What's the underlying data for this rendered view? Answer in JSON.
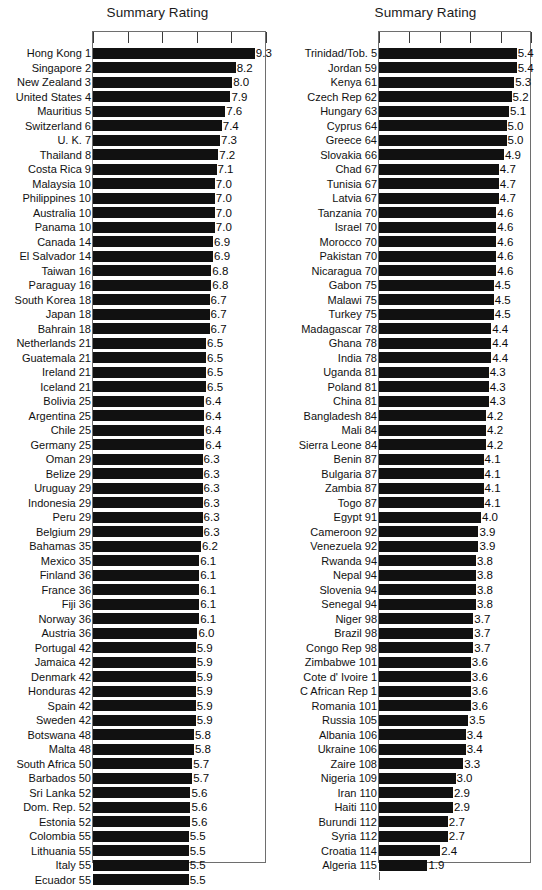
{
  "document": {
    "cut_off_heading": "Summary Ratings"
  },
  "chart_data": [
    {
      "panel": "left",
      "type": "bar",
      "orientation": "horizontal",
      "title": "Summary Rating",
      "xlabel": "",
      "ylabel": "",
      "xlim": [
        0,
        10
      ],
      "xticks": [
        0,
        2,
        4,
        6,
        8,
        10
      ],
      "grid": false,
      "legend": null,
      "tick_count": 6,
      "categories": [
        "Hong Kong 1",
        "Singapore 2",
        "New Zealand 3",
        "United States 4",
        "Mauritius 5",
        "Switzerland 6",
        "U. K. 7",
        "Thailand 8",
        "Costa Rica 9",
        "Malaysia 10",
        "Philippines 10",
        "Australia 10",
        "Panama 10",
        "Canada 14",
        "El Salvador 14",
        "Taiwan 16",
        "Paraguay 16",
        "South Korea 18",
        "Japan 18",
        "Bahrain 18",
        "Netherlands 21",
        "Guatemala 21",
        "Ireland 21",
        "Iceland 21",
        "Bolivia 25",
        "Argentina 25",
        "Chile 25",
        "Germany 25",
        "Oman 29",
        "Belize 29",
        "Uruguay 29",
        "Indonesia 29",
        "Peru 29",
        "Belgium 29",
        "Bahamas 35",
        "Mexico 35",
        "Finland 36",
        "France 36",
        "Fiji 36",
        "Norway 36",
        "Austria 36",
        "Portugal 42",
        "Jamaica 42",
        "Denmark 42",
        "Honduras 42",
        "Spain 42",
        "Sweden 42",
        "Botswana 48",
        "Malta 48",
        "South Africa 50",
        "Barbados 50",
        "Sri Lanka 52",
        "Dom. Rep. 52",
        "Estonia 52",
        "Colombia 55",
        "Lithuania 55",
        "Italy 55",
        "Ecuador 55"
      ],
      "values": [
        9.3,
        8.2,
        8.0,
        7.9,
        7.6,
        7.4,
        7.3,
        7.2,
        7.1,
        7.0,
        7.0,
        7.0,
        7.0,
        6.9,
        6.9,
        6.8,
        6.8,
        6.7,
        6.7,
        6.7,
        6.5,
        6.5,
        6.5,
        6.5,
        6.4,
        6.4,
        6.4,
        6.4,
        6.3,
        6.3,
        6.3,
        6.3,
        6.3,
        6.3,
        6.2,
        6.1,
        6.1,
        6.1,
        6.1,
        6.1,
        6.0,
        5.9,
        5.9,
        5.9,
        5.9,
        5.9,
        5.9,
        5.8,
        5.8,
        5.7,
        5.7,
        5.6,
        5.6,
        5.6,
        5.5,
        5.5,
        5.5,
        5.5
      ],
      "value_labels": [
        "9.3",
        "8.2",
        "8.0",
        "7.9",
        "7.6",
        "7.4",
        "7.3",
        "7.2",
        "7.1",
        "7.0",
        "7.0",
        "7.0",
        "7.0",
        "6.9",
        "6.9",
        "6.8",
        "6.8",
        "6.7",
        "6.7",
        "6.7",
        "6.5",
        "6.5",
        "6.5",
        "6.5",
        "6.4",
        "6.4",
        "6.4",
        "6.4",
        "6.3",
        "6.3",
        "6.3",
        "6.3",
        "6.3",
        "6.3",
        "6.2",
        "6.1",
        "6.1",
        "6.1",
        "6.1",
        "6.1",
        "6.0",
        "5.9",
        "5.9",
        "5.9",
        "5.9",
        "5.9",
        "5.9",
        "5.8",
        "5.8",
        "5.7",
        "5.7",
        "5.6",
        "5.6",
        "5.6",
        "5.5",
        "5.5",
        "5.5",
        "5.5"
      ]
    },
    {
      "panel": "right",
      "type": "bar",
      "orientation": "horizontal",
      "title": "Summary Rating",
      "xlabel": "",
      "ylabel": "",
      "xlim": [
        0,
        6
      ],
      "xticks": [
        0,
        1,
        2,
        3,
        4,
        5
      ],
      "grid": false,
      "legend": null,
      "tick_count": 6,
      "categories": [
        "Trinidad/Tob. 5",
        "Jordan 59",
        "Kenya 61",
        "Czech Rep 62",
        "Hungary 63",
        "Cyprus 64",
        "Greece 64",
        "Slovakia 66",
        "Chad 67",
        "Tunisia 67",
        "Latvia 67",
        "Tanzania 70",
        "Israel 70",
        "Morocco 70",
        "Pakistan 70",
        "Nicaragua 70",
        "Gabon 75",
        "Malawi 75",
        "Turkey 75",
        "Madagascar 78",
        "Ghana 78",
        "India 78",
        "Uganda 81",
        "Poland 81",
        "China 81",
        "Bangladesh 84",
        "Mali 84",
        "Sierra Leone 84",
        "Benin 87",
        "Bulgaria 87",
        "Zambia 87",
        "Togo 87",
        "Egypt 91",
        "Cameroon 92",
        "Venezuela 92",
        "Rwanda 94",
        "Nepal 94",
        "Slovenia 94",
        "Senegal 94",
        "Niger 98",
        "Brazil 98",
        "Congo Rep 98",
        "Zimbabwe 101",
        "Cote d' Ivoire 1",
        "C African Rep 1",
        "Romania 101",
        "Russia 105",
        "Albania 106",
        "Ukraine 106",
        "Zaire 108",
        "Nigeria 109",
        "Iran 110",
        "Haiti 110",
        "Burundi 112",
        "Syria 112",
        "Croatia 114",
        "Algeria 115"
      ],
      "values": [
        5.4,
        5.4,
        5.3,
        5.2,
        5.1,
        5.0,
        5.0,
        4.9,
        4.7,
        4.7,
        4.7,
        4.6,
        4.6,
        4.6,
        4.6,
        4.6,
        4.5,
        4.5,
        4.5,
        4.4,
        4.4,
        4.4,
        4.3,
        4.3,
        4.3,
        4.2,
        4.2,
        4.2,
        4.1,
        4.1,
        4.1,
        4.1,
        4.0,
        3.9,
        3.9,
        3.8,
        3.8,
        3.8,
        3.8,
        3.7,
        3.7,
        3.7,
        3.6,
        3.6,
        3.6,
        3.6,
        3.5,
        3.4,
        3.4,
        3.3,
        3.0,
        2.9,
        2.9,
        2.7,
        2.7,
        2.4,
        1.9
      ],
      "value_labels": [
        "5.4",
        "5.4",
        "5.3",
        "5.2",
        "5.1",
        "5.0",
        "5.0",
        "4.9",
        "4.7",
        "4.7",
        "4.7",
        "4.6",
        "4.6",
        "4.6",
        "4.6",
        "4.6",
        "4.5",
        "4.5",
        "4.5",
        "4.4",
        "4.4",
        "4.4",
        "4.3",
        "4.3",
        "4.3",
        "4.2",
        "4.2",
        "4.2",
        "4.1",
        "4.1",
        "4.1",
        "4.1",
        "4.0",
        "3.9",
        "3.9",
        "3.8",
        "3.8",
        "3.8",
        "3.8",
        "3.7",
        "3.7",
        "3.7",
        "3.6",
        "3.6",
        "3.6",
        "3.6",
        "3.5",
        "3.4",
        "3.4",
        "3.3",
        "3.0",
        "2.9",
        "2.9",
        "2.7",
        "2.7",
        "2.4",
        "1.9"
      ]
    }
  ],
  "colors": {
    "bar": "#111111",
    "frame": "#6e6e6e",
    "text": "#111111",
    "background": "#ffffff"
  }
}
